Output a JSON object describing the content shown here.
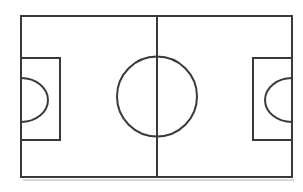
{
  "diagram": {
    "subtitle": "Schematic top-down line drawing",
    "kind": "sports-field-diagram",
    "sport": "soccer",
    "orientation": "landscape",
    "canvas": {
      "width": 303,
      "height": 192
    },
    "colors": {
      "background": "#ffffff",
      "line": "#3a3a3a",
      "surface": "#ffffff",
      "shadow": "#d8d8d8"
    },
    "line_width": 2,
    "labels": {
      "touchline": "Touchline",
      "goal_line": "Goal line",
      "halfway_line": "Halfway line",
      "centre_circle": "Centre circle",
      "penalty_area_left": "Left penalty area",
      "penalty_area_right": "Right penalty area",
      "penalty_arc_left": "Left penalty arc",
      "penalty_arc_right": "Right penalty arc"
    },
    "geometry": {
      "boundary": {
        "x": 21,
        "y": 16,
        "width": 271,
        "height": 161
      },
      "halfway_line": {
        "x": 157,
        "y1": 16,
        "y2": 177
      },
      "centre_circle": {
        "cx": 157,
        "cy": 96.5,
        "r": 40
      },
      "penalty_area_left": {
        "x": 21,
        "y": 58,
        "width": 39,
        "height": 82
      },
      "penalty_area_right": {
        "x": 253,
        "y": 58,
        "width": 39,
        "height": 82
      },
      "penalty_arc_left": {
        "cx": 21,
        "cy": 100,
        "rx": 27,
        "ry": 22,
        "bulge": "right"
      },
      "penalty_arc_right": {
        "cx": 292,
        "cy": 100,
        "rx": 27,
        "ry": 22,
        "bulge": "left"
      },
      "shadow": {
        "x1": 23,
        "y1": 180,
        "x2": 294,
        "y2": 180
      }
    }
  }
}
